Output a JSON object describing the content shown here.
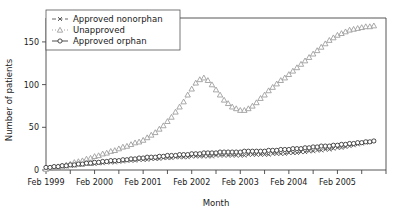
{
  "chart_data": {
    "type": "scatter",
    "title": "",
    "xlabel": "Month",
    "ylabel": "Number of patients",
    "ylim": [
      0,
      178
    ],
    "yticks": [
      0,
      50,
      100,
      150
    ],
    "ytick_labels": [
      "0",
      "50",
      "100",
      "150"
    ],
    "xlim": [
      0,
      84
    ],
    "xticks": [
      0,
      6,
      12,
      18,
      24,
      30,
      36,
      42,
      48,
      54,
      60,
      66,
      72,
      78,
      84
    ],
    "xtick_labels": [
      "Feb 1999",
      "",
      "Feb 2000",
      "",
      "Feb 2001",
      "",
      "Feb 2002",
      "",
      "Feb 2003",
      "",
      "Feb 2004",
      "",
      "Feb 2005",
      "",
      ""
    ],
    "xtick_major_labels": [
      "Feb 1999",
      "Feb 2000",
      "Feb 2001",
      "Feb 2002",
      "Feb 2003",
      "Feb 2004",
      "Feb 2005"
    ],
    "grid": false,
    "legend_position": "top-left",
    "series": [
      {
        "name": "Approved nonorphan",
        "marker": "x",
        "linestyle": "dashed",
        "color": "#555555",
        "x": [
          0,
          1,
          2,
          3,
          4,
          5,
          6,
          7,
          8,
          9,
          10,
          11,
          12,
          13,
          14,
          15,
          16,
          17,
          18,
          19,
          20,
          21,
          22,
          23,
          24,
          25,
          26,
          27,
          28,
          29,
          30,
          31,
          32,
          33,
          34,
          35,
          36,
          37,
          38,
          39,
          40,
          41,
          42,
          43,
          44,
          45,
          46,
          47,
          48,
          49,
          50,
          51,
          52,
          53,
          54,
          55,
          56,
          57,
          58,
          59,
          60,
          61,
          62,
          63,
          64,
          65,
          66,
          67,
          68,
          69,
          70,
          71,
          72,
          73,
          74,
          75,
          76,
          77,
          78,
          79,
          80,
          81
        ],
        "y": [
          2,
          2,
          3,
          3,
          4,
          4,
          5,
          5,
          6,
          6,
          7,
          7,
          7,
          8,
          8,
          9,
          9,
          9,
          10,
          10,
          11,
          11,
          11,
          12,
          12,
          12,
          13,
          13,
          13,
          14,
          14,
          14,
          15,
          15,
          15,
          15,
          16,
          16,
          16,
          16,
          16,
          16,
          17,
          17,
          17,
          17,
          17,
          17,
          17,
          17,
          18,
          18,
          18,
          18,
          18,
          18,
          19,
          19,
          19,
          19,
          20,
          20,
          20,
          21,
          21,
          22,
          22,
          23,
          23,
          24,
          24,
          25,
          26,
          26,
          27,
          28,
          29,
          30,
          31,
          32,
          33,
          34
        ]
      },
      {
        "name": "Unapproved",
        "marker": "triangle",
        "linestyle": "dotted",
        "color": "#9a9a9a",
        "x": [
          0,
          1,
          2,
          3,
          4,
          5,
          6,
          7,
          8,
          9,
          10,
          11,
          12,
          13,
          14,
          15,
          16,
          17,
          18,
          19,
          20,
          21,
          22,
          23,
          24,
          25,
          26,
          27,
          28,
          29,
          30,
          31,
          32,
          33,
          34,
          35,
          36,
          37,
          38,
          39,
          40,
          41,
          42,
          43,
          44,
          45,
          46,
          47,
          48,
          49,
          50,
          51,
          52,
          53,
          54,
          55,
          56,
          57,
          58,
          59,
          60,
          61,
          62,
          63,
          64,
          65,
          66,
          67,
          68,
          69,
          70,
          71,
          72,
          73,
          74,
          75,
          76,
          77,
          78,
          79,
          80,
          81
        ],
        "y": [
          1,
          2,
          3,
          4,
          5,
          6,
          7,
          9,
          10,
          11,
          13,
          14,
          16,
          17,
          19,
          20,
          22,
          23,
          25,
          27,
          28,
          30,
          32,
          33,
          35,
          38,
          41,
          44,
          48,
          52,
          57,
          62,
          68,
          74,
          80,
          88,
          95,
          102,
          106,
          108,
          105,
          100,
          94,
          88,
          82,
          78,
          74,
          72,
          70,
          70,
          72,
          75,
          79,
          84,
          88,
          93,
          97,
          101,
          105,
          108,
          112,
          116,
          120,
          124,
          128,
          132,
          136,
          140,
          144,
          148,
          152,
          155,
          158,
          160,
          162,
          164,
          165,
          166,
          167,
          168,
          168,
          169
        ]
      },
      {
        "name": "Approved orphan",
        "marker": "circle",
        "linestyle": "solid",
        "color": "#3a3a3a",
        "x": [
          0,
          1,
          2,
          3,
          4,
          5,
          6,
          7,
          8,
          9,
          10,
          11,
          12,
          13,
          14,
          15,
          16,
          17,
          18,
          19,
          20,
          21,
          22,
          23,
          24,
          25,
          26,
          27,
          28,
          29,
          30,
          31,
          32,
          33,
          34,
          35,
          36,
          37,
          38,
          39,
          40,
          41,
          42,
          43,
          44,
          45,
          46,
          47,
          48,
          49,
          50,
          51,
          52,
          53,
          54,
          55,
          56,
          57,
          58,
          59,
          60,
          61,
          62,
          63,
          64,
          65,
          66,
          67,
          68,
          69,
          70,
          71,
          72,
          73,
          74,
          75,
          76,
          77,
          78,
          79,
          80,
          81
        ],
        "y": [
          3,
          3,
          4,
          4,
          5,
          5,
          6,
          6,
          7,
          7,
          8,
          8,
          9,
          9,
          10,
          10,
          11,
          11,
          11,
          12,
          12,
          13,
          13,
          14,
          14,
          15,
          15,
          15,
          16,
          16,
          17,
          17,
          17,
          18,
          18,
          18,
          19,
          19,
          19,
          20,
          20,
          20,
          20,
          21,
          21,
          21,
          21,
          21,
          21,
          22,
          22,
          22,
          22,
          22,
          22,
          23,
          23,
          23,
          24,
          24,
          24,
          25,
          25,
          25,
          26,
          26,
          27,
          27,
          28,
          28,
          28,
          29,
          29,
          30,
          30,
          31,
          31,
          32,
          32,
          33,
          33,
          34
        ]
      }
    ],
    "legend": [
      {
        "label": "Approved nonorphan",
        "marker": "x",
        "linestyle": "dashed",
        "color": "#555555"
      },
      {
        "label": "Unapproved",
        "marker": "triangle",
        "linestyle": "dotted",
        "color": "#9a9a9a"
      },
      {
        "label": "Approved orphan",
        "marker": "circle",
        "linestyle": "solid",
        "color": "#3a3a3a"
      }
    ]
  }
}
